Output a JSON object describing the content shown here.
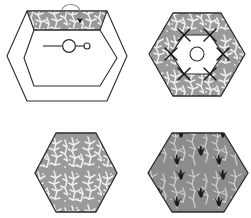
{
  "figure": {
    "background_color": "#ffffff",
    "width": 251,
    "height": 218,
    "line_color": "#2b2b2b",
    "panel_count": 4
  },
  "fabrics": {
    "vine_print": {
      "name": "gray-vine-print",
      "ground_color": "#9a9a9a",
      "motif_color": "#f2f2f2",
      "motif": "branching-vine"
    },
    "bird_print": {
      "name": "gray-bird-print",
      "ground_color": "#8a8a8a",
      "motif_color": "#ffffff",
      "accent_color": "#1e1e1e",
      "motif": "three-petal-sprig"
    }
  },
  "panels": [
    {
      "id": "panel-top-left",
      "name": "hexagon-with-single-patch",
      "label": "Step 1",
      "description": "Outer hexagon outline with inner hexagon outline and one top trapezoid patch applied",
      "outer_hexagon": {
        "cx": 67,
        "cy": 56,
        "rx": 60,
        "ry": 46
      },
      "inner_hexagon": {
        "cx": 67,
        "cy": 58,
        "rx": 43,
        "ry": 30
      },
      "patch": {
        "position": "top",
        "fabric": "vine_print"
      },
      "annotations": [
        {
          "type": "curved-arrow",
          "name": "fold-arrow",
          "direction": "down",
          "target": "top-patch"
        },
        {
          "type": "pin-marker",
          "name": "pin-marker",
          "description": "line with large circle and small circle"
        }
      ]
    },
    {
      "id": "panel-top-right",
      "name": "hexagon-ring-complete",
      "label": "Step 2",
      "description": "Completed hexagon ring of six trapezoid patches with seam cross marks at inner vertices and center circle",
      "outer_hexagon": {
        "cx": 197,
        "cy": 54,
        "rx": 48,
        "ry": 45
      },
      "inner_hexagon": {
        "cx": 197,
        "cy": 54,
        "rx": 26,
        "ry": 24
      },
      "center_circle_radius": 7,
      "seam_marks": 6,
      "fabric": "vine_print"
    },
    {
      "id": "panel-bottom-left",
      "name": "hexagon-vine-fabric",
      "label": "Fabric A",
      "description": "Solid hexagon cut from gray vine print",
      "hexagon": {
        "cx": 76,
        "cy": 173,
        "rx": 41,
        "ry": 40
      },
      "fabric": "vine_print"
    },
    {
      "id": "panel-bottom-right",
      "name": "hexagon-bird-fabric",
      "label": "Fabric B",
      "description": "Solid hexagon cut from gray bird sprig print",
      "hexagon": {
        "cx": 198,
        "cy": 173,
        "rx": 48,
        "ry": 40
      },
      "fabric": "bird_print"
    }
  ]
}
